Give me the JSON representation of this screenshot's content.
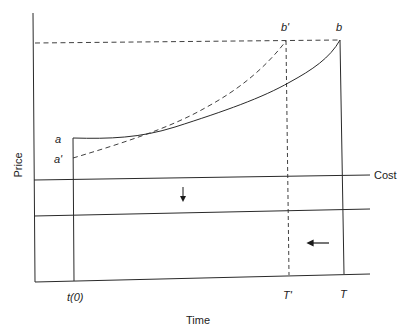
{
  "diagram": {
    "title": "",
    "axes": {
      "y_label": "Price",
      "x_label": "Time"
    },
    "x_ticks": {
      "t0": "t(0)",
      "t_prime": "T'",
      "t": "T"
    },
    "points": {
      "a": "a",
      "a_prime": "a'",
      "b": "b",
      "b_prime": "b'"
    },
    "lines": {
      "cost_label": "Cost"
    },
    "curves": [
      {
        "name": "price-path-a-b",
        "style": "solid",
        "from": "a",
        "to": "b"
      },
      {
        "name": "price-path-a-prime-b-prime",
        "style": "dashed",
        "from": "a'",
        "to": "b'"
      }
    ],
    "arrows": [
      {
        "name": "cost-shift-arrow",
        "direction": "down"
      },
      {
        "name": "time-shift-arrow",
        "direction": "left"
      }
    ]
  }
}
